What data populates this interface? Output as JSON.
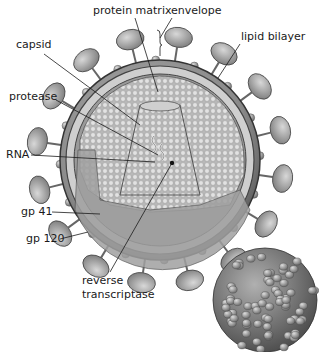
{
  "diagram": {
    "labels": [
      {
        "id": "protein-matrix",
        "text": "protein matrix",
        "x": 93,
        "y": 14,
        "lx1": 135,
        "ly1": 18,
        "lx2": 158,
        "ly2": 92
      },
      {
        "id": "envelope",
        "text": "envelope",
        "x": 171,
        "y": 14,
        "lx1": 172,
        "ly1": 18,
        "lx2": 160,
        "ly2": 38
      },
      {
        "id": "lipid-bilayer",
        "text": "lipid bilayer",
        "x": 241,
        "y": 40,
        "lx1": 240,
        "ly1": 44,
        "lx2": 218,
        "ly2": 78
      },
      {
        "id": "capsid",
        "text": "capsid",
        "x": 16,
        "y": 48,
        "lx1": 44,
        "ly1": 54,
        "lx2": 140,
        "ly2": 125
      },
      {
        "id": "protease",
        "text": "protease",
        "x": 9,
        "y": 100,
        "lx1": 56,
        "ly1": 100,
        "lx2": 158,
        "ly2": 155
      },
      {
        "id": "rna",
        "text": "RNA",
        "x": 6,
        "y": 158,
        "lx1": 31,
        "ly1": 155,
        "lx2": 155,
        "ly2": 162
      },
      {
        "id": "gp41",
        "text": "gp 41",
        "x": 21,
        "y": 215,
        "lx1": 52,
        "ly1": 212,
        "lx2": 100,
        "ly2": 214
      },
      {
        "id": "gp120",
        "text": "gp 120",
        "x": 26,
        "y": 242,
        "lx1": 60,
        "ly1": 239,
        "lx2": 88,
        "ly2": 232
      },
      {
        "id": "reverse-transcriptase",
        "text": "reverse",
        "text2": "transcriptase",
        "x": 82,
        "y": 284,
        "y2": 298,
        "lx1": 110,
        "ly1": 272,
        "lx2": 172,
        "ly2": 163
      }
    ]
  },
  "colors": {
    "outer_shell": "#8c8c8c",
    "membrane_light": "#cfcfcf",
    "interior": "#b5b5b5",
    "matrix_dots": "#d9d9d9",
    "spike_head": "#a8a8a8",
    "text": "#1a1a1a"
  }
}
